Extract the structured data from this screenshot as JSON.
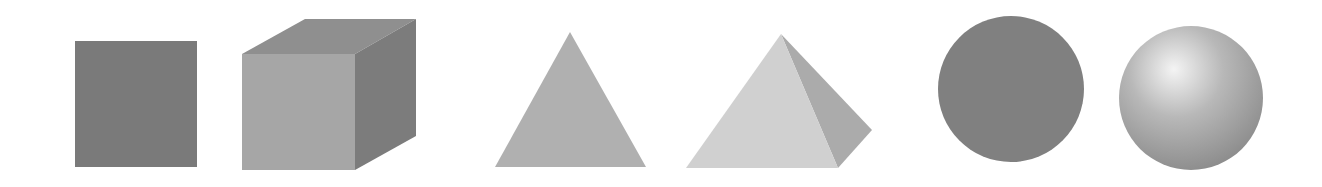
{
  "figure": {
    "background": "#ffffff",
    "pairs": [
      {
        "flat": "square",
        "solid": "cube"
      },
      {
        "flat": "triangle",
        "solid": "pyramid"
      },
      {
        "flat": "circle",
        "solid": "sphere"
      }
    ],
    "colors": {
      "square": "#7a7a7a",
      "cube_front": "#a6a6a6",
      "cube_top": "#8f8f8f",
      "cube_right": "#7c7c7c",
      "triangle": "#b0b0b0",
      "pyramid_front": "#d0d0d0",
      "pyramid_right": "#ababab",
      "circle": "#808080",
      "sphere_highlight": "#f4f4f4",
      "sphere_mid": "#b8b8b8",
      "sphere_edge": "#8a8a8a"
    }
  }
}
